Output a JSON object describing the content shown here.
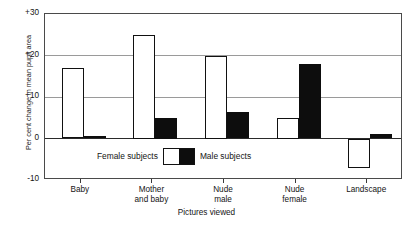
{
  "chart_data": {
    "type": "bar",
    "title": "",
    "xlabel": "Pictures viewed",
    "ylabel": "Per cent change in mean pupil area",
    "categories": [
      "Baby",
      "Mother\nand baby",
      "Nude\nmale",
      "Nude\nfemale",
      "Landscape"
    ],
    "series": [
      {
        "name": "Female subjects",
        "values": [
          17,
          25,
          20,
          5,
          -7
        ],
        "color": "#ffffff",
        "edge": "#111111"
      },
      {
        "name": "Male subjects",
        "values": [
          0.5,
          5,
          6.5,
          18,
          1
        ],
        "color": "#0d0d0d",
        "edge": "#0d0d0d"
      }
    ],
    "ylim": [
      -10,
      30
    ],
    "yticks": [
      "+30",
      "+20",
      "+10",
      "0",
      "-10"
    ],
    "ytick_values": [
      30,
      20,
      10,
      0,
      -10
    ],
    "gridlines": [
      30,
      20,
      10,
      0,
      -10
    ],
    "grid": true,
    "legend_position": "inside-lower-center"
  },
  "axis": {
    "y_title": "Per cent change in mean pupil area",
    "x_title": "Pictures viewed",
    "y_tick_labels": [
      "+30",
      "+20",
      "+10",
      "0",
      "-10"
    ],
    "x_tick_labels": [
      {
        "line1": "Baby",
        "line2": ""
      },
      {
        "line1": "Mother",
        "line2": "and baby"
      },
      {
        "line1": "Nude",
        "line2": "male"
      },
      {
        "line1": "Nude",
        "line2": "female"
      },
      {
        "line1": "Landscape",
        "line2": ""
      }
    ]
  },
  "legend": {
    "female_label": "Female subjects",
    "male_label": "Male subjects"
  },
  "credit": ""
}
